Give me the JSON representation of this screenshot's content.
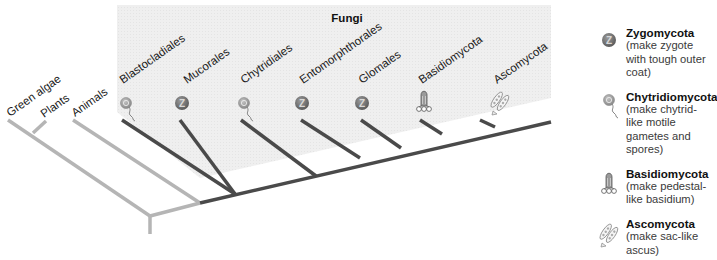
{
  "diagram": {
    "group_title": "Fungi",
    "outgroups": [
      {
        "label": "Green algae"
      },
      {
        "label": "Plants"
      },
      {
        "label": "Animals"
      }
    ],
    "fungal_taxa": [
      {
        "label": "Blastocladiales",
        "icon": "chytrid-spore-icon"
      },
      {
        "label": "Mucorales",
        "icon": "zygote-icon"
      },
      {
        "label": "Chytridiales",
        "icon": "chytrid-spore-icon"
      },
      {
        "label": "Entomorphthorales",
        "icon": "zygote-icon"
      },
      {
        "label": "Glomales",
        "icon": "zygote-icon"
      },
      {
        "label": "Basidiomycota",
        "icon": "basidium-icon"
      },
      {
        "label": "Ascomycota",
        "icon": "ascus-icon"
      }
    ],
    "colors": {
      "outgroup_branch": "#b5b5b5",
      "fungi_branch": "#4a4a4a",
      "fungi_panel": "#eeeeee"
    }
  },
  "legend": [
    {
      "icon": "zygote-icon",
      "name": "Zygomycota",
      "desc": "(make zygote with tough outer coat)"
    },
    {
      "icon": "chytrid-spore-icon",
      "name": "Chytridiomycota",
      "desc": "(make chytrid-like motile gametes and spores)"
    },
    {
      "icon": "basidium-icon",
      "name": "Basidiomycota",
      "desc": "(make pedestal-like basidium)"
    },
    {
      "icon": "ascus-icon",
      "name": "Ascomycota",
      "desc": "(make sac-like ascus)"
    }
  ]
}
